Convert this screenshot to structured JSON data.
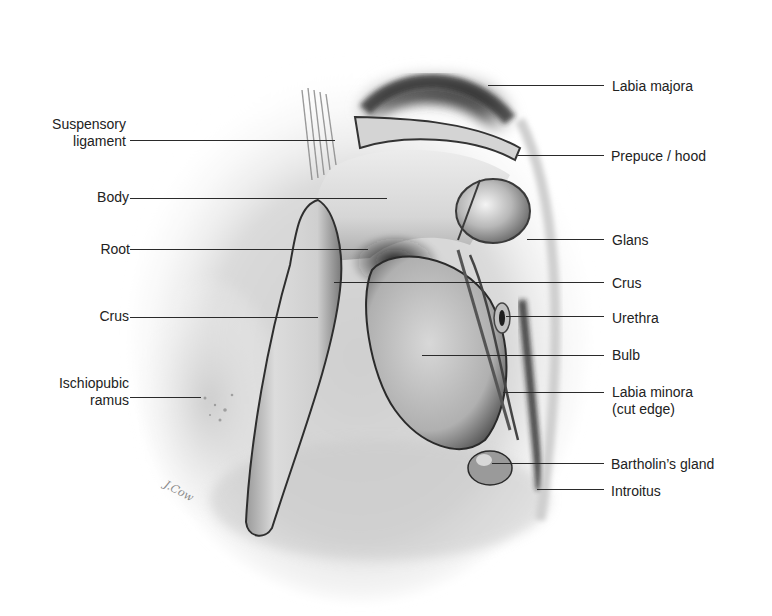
{
  "diagram": {
    "signature": "J.Cow",
    "labels_left": [
      {
        "id": "suspensory-ligament",
        "text_lines": [
          "Suspensory",
          "ligament"
        ],
        "text_right_x": 126,
        "text_top_y": 116,
        "line": {
          "x1": 130,
          "x2": 335,
          "y": 140
        }
      },
      {
        "id": "body",
        "text_lines": [
          "Body"
        ],
        "text_right_x": 129,
        "text_top_y": 189,
        "line": {
          "x1": 130,
          "x2": 387,
          "y": 198
        }
      },
      {
        "id": "root",
        "text_lines": [
          "Root"
        ],
        "text_right_x": 130,
        "text_top_y": 241,
        "line": {
          "x1": 130,
          "x2": 368,
          "y": 249
        }
      },
      {
        "id": "crus-left",
        "text_lines": [
          "Crus"
        ],
        "text_right_x": 129,
        "text_top_y": 308,
        "line": {
          "x1": 130,
          "x2": 318,
          "y": 317
        }
      },
      {
        "id": "ischiopubic-ramus",
        "text_lines": [
          "Ischiopubic",
          "ramus"
        ],
        "text_right_x": 129,
        "text_top_y": 375,
        "line": {
          "x1": 130,
          "x2": 201,
          "y": 397
        }
      }
    ],
    "labels_right": [
      {
        "id": "labia-majora",
        "text_lines": [
          "Labia majora"
        ],
        "text_left_x": 612,
        "text_top_y": 78,
        "line": {
          "x1": 488,
          "x2": 604,
          "y": 85
        }
      },
      {
        "id": "prepuce-hood",
        "text_lines": [
          "Prepuce / hood"
        ],
        "text_left_x": 611,
        "text_top_y": 148,
        "line": {
          "x1": 518,
          "x2": 604,
          "y": 155
        }
      },
      {
        "id": "glans",
        "text_lines": [
          "Glans"
        ],
        "text_left_x": 612,
        "text_top_y": 232,
        "line": {
          "x1": 527,
          "x2": 604,
          "y": 239
        }
      },
      {
        "id": "crus-right",
        "text_lines": [
          "Crus"
        ],
        "text_left_x": 612,
        "text_top_y": 275,
        "line": {
          "x1": 334,
          "x2": 604,
          "y": 282
        }
      },
      {
        "id": "urethra",
        "text_lines": [
          "Urethra"
        ],
        "text_left_x": 612,
        "text_top_y": 310,
        "line": {
          "x1": 506,
          "x2": 604,
          "y": 316
        }
      },
      {
        "id": "bulb",
        "text_lines": [
          "Bulb"
        ],
        "text_left_x": 612,
        "text_top_y": 347,
        "line": {
          "x1": 422,
          "x2": 604,
          "y": 355
        }
      },
      {
        "id": "labia-minora-cut-edge",
        "text_lines": [
          "Labia minora",
          "(cut edge)"
        ],
        "text_left_x": 612,
        "text_top_y": 384,
        "line": {
          "x1": 503,
          "x2": 604,
          "y": 392
        }
      },
      {
        "id": "bartholins-gland",
        "text_lines": [
          "Bartholin’s gland"
        ],
        "text_left_x": 611,
        "text_top_y": 456,
        "line": {
          "x1": 492,
          "x2": 604,
          "y": 463
        }
      },
      {
        "id": "introitus",
        "text_lines": [
          "Introitus"
        ],
        "text_left_x": 611,
        "text_top_y": 483,
        "line": {
          "x1": 537,
          "x2": 604,
          "y": 489
        }
      }
    ],
    "colors": {
      "background": "#ffffff",
      "label_text": "#222222",
      "leader_line": "#2a2a2a",
      "tissue_light": "#e4e4e4",
      "tissue_mid": "#b5b5b5",
      "tissue_dark": "#4a4a4a",
      "shadow": "#1e1e1e"
    }
  }
}
